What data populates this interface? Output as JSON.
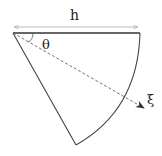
{
  "diagram": {
    "labels": {
      "width": "h",
      "angle": "θ",
      "direction": "ξ"
    },
    "colors": {
      "stroke": "#444444",
      "dim_line": "#aaaaaa",
      "dashed": "#666666"
    }
  }
}
